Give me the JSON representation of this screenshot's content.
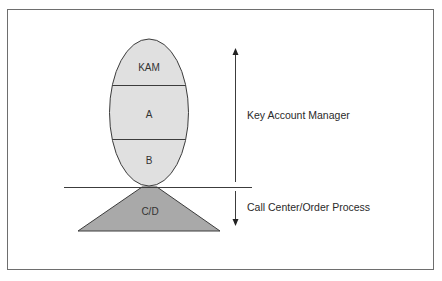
{
  "diagram": {
    "segments": [
      {
        "id": "kam",
        "label": "KAM"
      },
      {
        "id": "a",
        "label": "A"
      },
      {
        "id": "b",
        "label": "B"
      }
    ],
    "base": {
      "label": "C/D"
    },
    "annotations": {
      "upper": "Key Account Manager",
      "lower": "Call Center/Order Process"
    },
    "colors": {
      "ellipse_fill": "#e0e0e0",
      "triangle_fill": "#a9a9a9",
      "stroke": "#3c3c3c"
    }
  }
}
